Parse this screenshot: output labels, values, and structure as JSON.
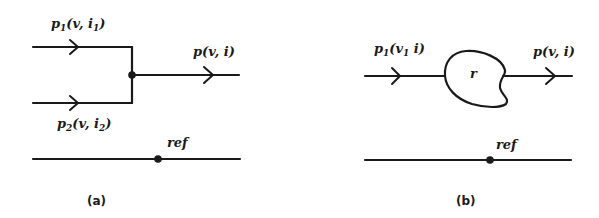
{
  "panel_a": {
    "caption": "(a)",
    "input1": {
      "label": "p",
      "sub": "1",
      "args": "(v, i",
      "arg_sub": "1",
      "close": ")"
    },
    "input2": {
      "label": "p",
      "sub": "2",
      "args": "(v, i",
      "arg_sub": "2",
      "close": ")"
    },
    "output": {
      "label": "p(v, i)"
    },
    "ref": {
      "label": "ref"
    }
  },
  "panel_b": {
    "caption": "(b)",
    "input1": {
      "label": "p",
      "sub": "1",
      "args": "(v",
      "arg_sub": "1",
      "rest": " i)"
    },
    "element": {
      "label": "r"
    },
    "output": {
      "label": "p(v, i)"
    },
    "ref": {
      "label": "ref"
    }
  },
  "colors": {
    "ink": "#1a1a1a",
    "background": "#ffffff"
  }
}
